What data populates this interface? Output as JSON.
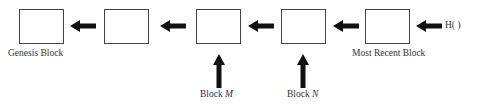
{
  "diagram": {
    "type": "blockchain hash-pointer chain",
    "blocks": [
      {
        "id": "genesis",
        "label": "Genesis Block"
      },
      {
        "id": "block2",
        "label": ""
      },
      {
        "id": "blockM",
        "label": ""
      },
      {
        "id": "blockN",
        "label": ""
      },
      {
        "id": "recent",
        "label": "Most Recent Block"
      }
    ],
    "pointer_labels": {
      "head": "H( )",
      "block_m_prefix": "Block ",
      "block_m_var": "M",
      "block_n_prefix": "Block ",
      "block_n_var": "N"
    },
    "colors": {
      "line": "#444444",
      "arrow": "#111111",
      "text": "#333333"
    }
  }
}
